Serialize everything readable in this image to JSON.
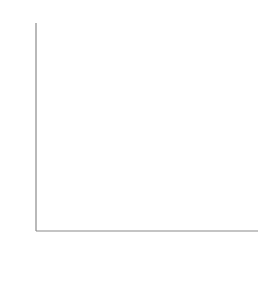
{
  "chart_data": {
    "type": "line",
    "xlabel": "",
    "ylabel": "",
    "categories": [
      "50. Tag",
      "51. Tag",
      "52. Tag",
      "53. Tag",
      "54. Tag",
      "55. Tag",
      "56. Tag"
    ],
    "y_ticks": [
      "10",
      "9",
      "8",
      "7",
      "6",
      "5",
      "4",
      "3",
      "2",
      "1"
    ],
    "ylim": [
      0,
      10
    ],
    "series": [],
    "grid": true,
    "legend": null,
    "note": "Empty tracking grid — no data points plotted"
  },
  "colors": {
    "axis": "#8a8a8a",
    "grid": "#c8c8c8",
    "text": "#555555"
  }
}
